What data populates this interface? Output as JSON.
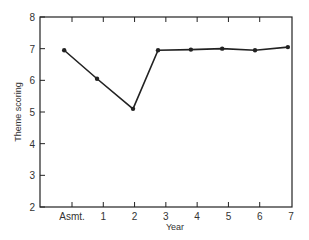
{
  "chart_data": {
    "type": "line",
    "title": "",
    "xlabel": "Year",
    "ylabel": "Theme scoring",
    "x_tick_labels": [
      "Asmt.",
      "1",
      "2",
      "3",
      "4",
      "5",
      "6",
      "7"
    ],
    "y_tick_labels": [
      "2",
      "3",
      "4",
      "5",
      "6",
      "7",
      "8"
    ],
    "ylim": [
      2,
      8
    ],
    "grid": false,
    "legend": null,
    "series": [
      {
        "name": "Theme scoring",
        "x": [
          -0.25,
          0.8,
          1.95,
          2.75,
          3.8,
          4.8,
          5.85,
          6.9
        ],
        "x_categories_approx": [
          "Asmt.",
          "1",
          "2",
          "3",
          "4",
          "5",
          "6",
          "7"
        ],
        "values": [
          6.95,
          6.05,
          5.1,
          6.95,
          6.97,
          7.0,
          6.95,
          7.05
        ]
      }
    ]
  }
}
